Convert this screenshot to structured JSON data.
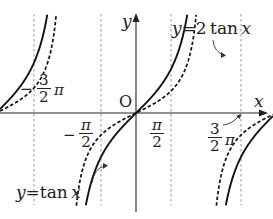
{
  "chart_data": {
    "type": "line",
    "title": "",
    "xlabel": "x",
    "ylabel": "y",
    "origin_label": "O",
    "series": [
      {
        "name": "y = tan x",
        "style": "dashed",
        "formula": "tan(x)"
      },
      {
        "name": "y = 2 tan x",
        "style": "solid",
        "formula": "2*tan(x)"
      }
    ],
    "asymptotes": [
      "-3/2 π",
      "-π/2",
      "π/2",
      "3/2 π"
    ],
    "x_tick_labels": [
      {
        "num": "3",
        "den": "2",
        "suffix": "π",
        "sign": "−",
        "value": "-3π/2"
      },
      {
        "num": "π",
        "den": "2",
        "sign": "−",
        "value": "-π/2"
      },
      {
        "num": "π",
        "den": "2",
        "sign": "",
        "value": "π/2"
      },
      {
        "num": "3",
        "den": "2",
        "suffix": "π",
        "sign": "",
        "value": "3π/2"
      }
    ],
    "annotations": [
      "y = 2 tan x",
      "y = tan x"
    ],
    "grid": false,
    "legend": "none"
  },
  "labels": {
    "y_axis": "y",
    "x_axis": "x",
    "origin": "O",
    "curve_2tan": {
      "y": "y",
      "eq": "=",
      "coef": "2",
      "fn": "tan",
      "var": "x"
    },
    "curve_tan": {
      "y": "y",
      "eq": "=",
      "fn": "tan",
      "var": "x"
    },
    "neg_three_half_pi": {
      "sign": "−",
      "num": "3",
      "den": "2",
      "pi": "π"
    },
    "neg_half_pi": {
      "sign": "−",
      "num": "π",
      "den": "2"
    },
    "half_pi": {
      "num": "π",
      "den": "2"
    },
    "three_half_pi": {
      "num": "3",
      "den": "2",
      "pi": "π"
    }
  },
  "colors": {
    "curve": "#111111",
    "axis": "#222222",
    "asymptote": "#777777",
    "background": "#ffffff"
  }
}
